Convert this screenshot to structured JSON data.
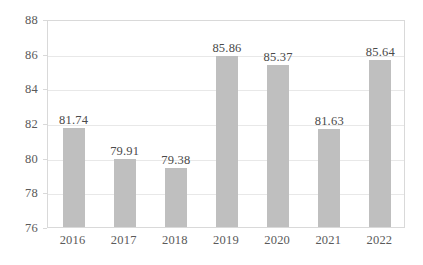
{
  "chart_data": {
    "type": "bar",
    "title": "",
    "subtitle": "",
    "xlabel": "",
    "ylabel": "",
    "categories": [
      "2016",
      "2017",
      "2018",
      "2019",
      "2020",
      "2021",
      "2022"
    ],
    "values": [
      81.74,
      79.91,
      79.38,
      85.86,
      85.37,
      81.63,
      85.64
    ],
    "data_labels": [
      "81.74",
      "79.91",
      "79.38",
      "85.86",
      "85.37",
      "81.63",
      "85.64"
    ],
    "ylim": [
      76,
      88
    ],
    "ytick_values": [
      76,
      78,
      80,
      82,
      84,
      86,
      88
    ],
    "ytick_labels": [
      "76",
      "78",
      "80",
      "82",
      "84",
      "86",
      "88"
    ],
    "grid": true,
    "grid_axis": "y",
    "legend": false,
    "legend_position": "none",
    "bar_color": "#bfbfbf",
    "gridline_color": "#e8e8e8",
    "border_color": "#d9d9d9",
    "axis_text_color": "#5a5a5a",
    "label_text_color": "#4a4a4a",
    "background_color": "#ffffff"
  }
}
